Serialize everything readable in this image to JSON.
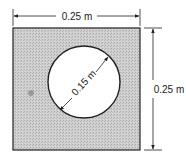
{
  "diagram": {
    "type": "square-plate-with-circular-hole",
    "plate": {
      "width_label": "0.25 m",
      "height_label": "0.25 m",
      "fill_color": "#c8c8c8",
      "edge_color": "#222222"
    },
    "hole": {
      "diameter_label": "0.15 m",
      "fill_color": "#ffffff"
    }
  }
}
